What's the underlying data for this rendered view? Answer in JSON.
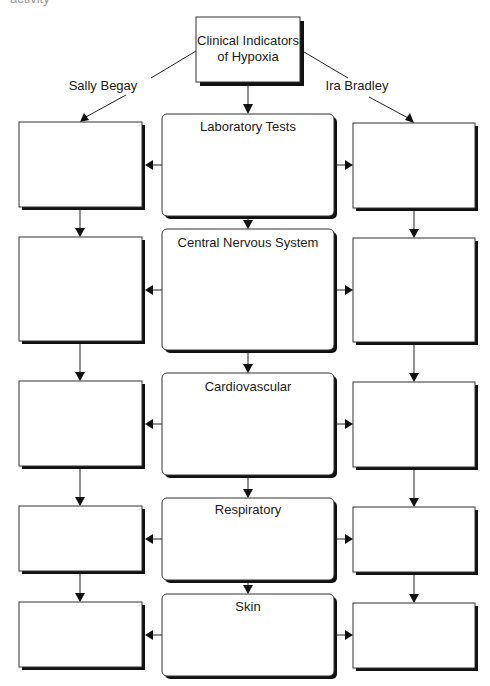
{
  "page": {
    "cropped_top_text": "activity"
  },
  "diagram": {
    "root": {
      "line1": "Clinical Indicators",
      "line2": "of Hypoxia"
    },
    "branches": {
      "left": "Sally Begay",
      "right": "Ira Bradley"
    },
    "categories": [
      {
        "label": "Laboratory Tests"
      },
      {
        "label": "Central Nervous System"
      },
      {
        "label": "Cardiovascular"
      },
      {
        "label": "Respiratory"
      },
      {
        "label": "Skin"
      }
    ],
    "left_column_boxes": [
      "",
      "",
      "",
      "",
      ""
    ],
    "right_column_boxes": [
      "",
      "",
      "",
      "",
      ""
    ]
  },
  "colors": {
    "stroke": "#333333",
    "shadow": "#111111",
    "background": "#ffffff"
  }
}
